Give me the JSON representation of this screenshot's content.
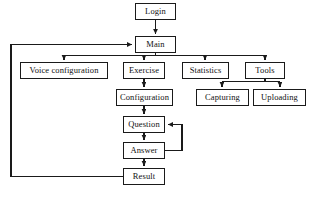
{
  "diagram": {
    "type": "flowchart",
    "stroke_color": "#1a1a1a",
    "fill_color": "#ffffff",
    "nodes": [
      {
        "id": "login",
        "label": "Login",
        "x": 135,
        "y": 3,
        "w": 41,
        "h": 17
      },
      {
        "id": "main",
        "label": "Main",
        "x": 135,
        "y": 36,
        "w": 41,
        "h": 17
      },
      {
        "id": "voice",
        "label": "Voice configuration",
        "x": 20,
        "y": 62,
        "w": 88,
        "h": 17
      },
      {
        "id": "exercise",
        "label": "Exercise",
        "x": 123,
        "y": 62,
        "w": 42,
        "h": 17
      },
      {
        "id": "stats",
        "label": "Statistics",
        "x": 182,
        "y": 62,
        "w": 47,
        "h": 17
      },
      {
        "id": "tools",
        "label": "Tools",
        "x": 245,
        "y": 62,
        "w": 40,
        "h": 17
      },
      {
        "id": "config",
        "label": "Configuration",
        "x": 116,
        "y": 89,
        "w": 57,
        "h": 17
      },
      {
        "id": "capture",
        "label": "Capturing",
        "x": 196,
        "y": 89,
        "w": 53,
        "h": 17
      },
      {
        "id": "upload",
        "label": "Uploading",
        "x": 253,
        "y": 89,
        "w": 53,
        "h": 17
      },
      {
        "id": "question",
        "label": "Question",
        "x": 123,
        "y": 116,
        "w": 42,
        "h": 17
      },
      {
        "id": "answer",
        "label": "Answer",
        "x": 123,
        "y": 142,
        "w": 42,
        "h": 17
      },
      {
        "id": "result",
        "label": "Result",
        "x": 123,
        "y": 168,
        "w": 42,
        "h": 17
      }
    ],
    "edges": [
      {
        "id": "login-to-main",
        "from": "login",
        "to": "main",
        "kind": "vertical-arrow"
      },
      {
        "id": "main-to-voice",
        "from": "main",
        "to": "voice",
        "kind": "bus-branch"
      },
      {
        "id": "main-to-exercise",
        "from": "main",
        "to": "exercise",
        "kind": "bus-branch"
      },
      {
        "id": "main-to-statistics",
        "from": "main",
        "to": "stats",
        "kind": "bus-branch"
      },
      {
        "id": "main-to-tools",
        "from": "main",
        "to": "tools",
        "kind": "bus-branch"
      },
      {
        "id": "exercise-to-config",
        "from": "exercise",
        "to": "config",
        "kind": "vertical-arrow"
      },
      {
        "id": "tools-to-capturing",
        "from": "tools",
        "to": "capture",
        "kind": "bus-branch"
      },
      {
        "id": "tools-to-uploading",
        "from": "tools",
        "to": "upload",
        "kind": "bus-branch"
      },
      {
        "id": "config-to-question",
        "from": "config",
        "to": "question",
        "kind": "vertical-arrow"
      },
      {
        "id": "question-to-answer",
        "from": "question",
        "to": "answer",
        "kind": "vertical-arrow"
      },
      {
        "id": "answer-to-question",
        "from": "answer",
        "to": "question",
        "kind": "feedback-right-loop"
      },
      {
        "id": "answer-to-result",
        "from": "answer",
        "to": "result",
        "kind": "vertical-arrow"
      },
      {
        "id": "result-to-main",
        "from": "result",
        "to": "main",
        "kind": "feedback-left-loop"
      }
    ]
  }
}
